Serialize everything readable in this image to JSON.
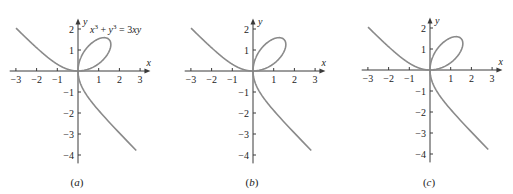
{
  "chart_data": [
    {
      "type": "line",
      "panel_label": "(a)",
      "caption_letter": "a",
      "equation": {
        "lhs": "x",
        "exp1": "3",
        "plus": " + y",
        "exp2": "3",
        "rhs": " = 3xy"
      },
      "show_equation": true,
      "xlabel": "x",
      "ylabel": "y",
      "xlim": [
        -3.3,
        3.5
      ],
      "ylim": [
        -4.4,
        2.5
      ],
      "xticks": [
        -3,
        -2,
        -1,
        1,
        2,
        3
      ],
      "yticks": [
        2,
        1,
        -1,
        -2,
        -3,
        -4
      ],
      "grid": false,
      "series": [
        {
          "name": "x^3 + y^3 = 3xy (folium of Descartes)",
          "parametric": "x=3t/(1+t^3), y=3t^2/(1+t^3)"
        }
      ]
    },
    {
      "type": "line",
      "panel_label": "(b)",
      "caption_letter": "b",
      "show_equation": false,
      "xlabel": "x",
      "ylabel": "y",
      "xlim": [
        -3.3,
        3.5
      ],
      "ylim": [
        -4.4,
        2.5
      ],
      "xticks": [
        -3,
        -2,
        -1,
        1,
        2,
        3
      ],
      "yticks": [
        2,
        1,
        -1,
        -2,
        -3,
        -4
      ],
      "grid": false,
      "series": [
        {
          "name": "x^3 + y^3 = 3xy",
          "parametric": "x=3t/(1+t^3), y=3t^2/(1+t^3)"
        }
      ]
    },
    {
      "type": "line",
      "panel_label": "(c)",
      "caption_letter": "c",
      "show_equation": false,
      "xlabel": "x",
      "ylabel": "y",
      "xlim": [
        -3.3,
        3.5
      ],
      "ylim": [
        -4.4,
        2.5
      ],
      "xticks": [
        -3,
        -2,
        -1,
        1,
        2,
        3
      ],
      "yticks": [
        2,
        1,
        -1,
        -2,
        -3,
        -4
      ],
      "grid": false,
      "series": [
        {
          "name": "x^3 + y^3 = 3xy",
          "parametric": "x=3t/(1+t^3), y=3t^2/(1+t^3)"
        }
      ]
    }
  ],
  "panels": [
    {
      "origin_x": 78,
      "origin_y": 71,
      "unit_x": 20.7,
      "unit_y": 21.0,
      "caption": "(a)",
      "caption_y": 186
    },
    {
      "origin_x": 253,
      "origin_y": 71,
      "unit_x": 20.7,
      "unit_y": 21.0,
      "caption": "(b)",
      "caption_y": 186
    },
    {
      "origin_x": 430,
      "origin_y": 70,
      "unit_x": 20.7,
      "unit_y": 21.0,
      "caption": "(c)",
      "caption_y": 186
    }
  ],
  "colors": {
    "curve": "#8a8a8a",
    "axis": "#3a3a3a",
    "text": "#222222"
  }
}
